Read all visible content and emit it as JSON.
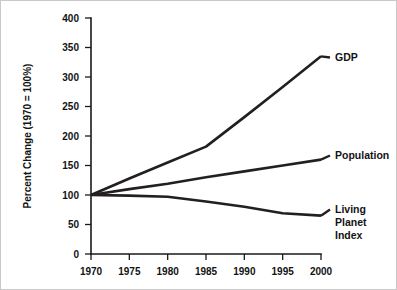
{
  "chart_data": {
    "type": "line",
    "title": "",
    "xlabel": "",
    "ylabel": "Percent Change (1970 = 100%)",
    "xlim": [
      1970,
      2000
    ],
    "ylim": [
      0,
      400
    ],
    "grid": false,
    "legend_position": "right-inline-labels",
    "x": [
      1970,
      1975,
      1980,
      1985,
      1990,
      1995,
      2000
    ],
    "xtick_labels": [
      "1970",
      "1975",
      "1980",
      "1985",
      "1990",
      "1995",
      "2000"
    ],
    "ytick_values": [
      0,
      50,
      100,
      150,
      200,
      250,
      300,
      350,
      400
    ],
    "ytick_labels": [
      "0",
      "50",
      "100",
      "150",
      "200",
      "250",
      "300",
      "350",
      "400"
    ],
    "series": [
      {
        "name": "GDP",
        "label_lines": [
          "GDP"
        ],
        "color": "#231f20",
        "values": [
          100,
          128,
          155,
          182,
          232,
          283,
          335
        ]
      },
      {
        "name": "Population",
        "label_lines": [
          "Population"
        ],
        "color": "#231f20",
        "values": [
          100,
          110,
          119,
          130,
          140,
          150,
          160
        ]
      },
      {
        "name": "Living Planet Index",
        "label_lines": [
          "Living",
          "Planet",
          "Index"
        ],
        "color": "#231f20",
        "values": [
          100,
          99,
          97,
          89,
          80,
          69,
          65
        ]
      }
    ]
  }
}
